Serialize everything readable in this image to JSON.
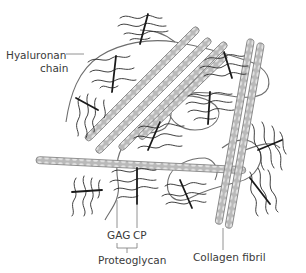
{
  "diagram": {
    "type": "extracellular-matrix-schematic",
    "labels": {
      "hyaluronan_line1": "Hyaluronan",
      "hyaluronan_line2": "chain",
      "gag": "GAG",
      "cp": "CP",
      "proteoglycan": "Proteoglycan",
      "collagen_fibril": "Collagen fibril"
    },
    "components": [
      {
        "id": "hyaluronan-chain",
        "name": "Hyaluronan chain",
        "style": "thin gray looping line"
      },
      {
        "id": "proteoglycan",
        "name": "Proteoglycan",
        "parts": [
          "GAG",
          "CP"
        ],
        "style": "black core protein bar with wavy GAG side chains"
      },
      {
        "id": "collagen-fibril",
        "name": "Collagen fibril",
        "style": "banded gray rods"
      }
    ],
    "colors": {
      "fibril_fill": "#bdbdbd",
      "fibril_band": "#e6e6e6",
      "fibril_edge": "#7a7a7a",
      "hyaluronan": "#6e6e6e",
      "core_protein": "#1a1a1a",
      "gag_chain": "#2a2a2a",
      "label_text": "#3a3a3a",
      "leader_line": "#777777"
    }
  }
}
